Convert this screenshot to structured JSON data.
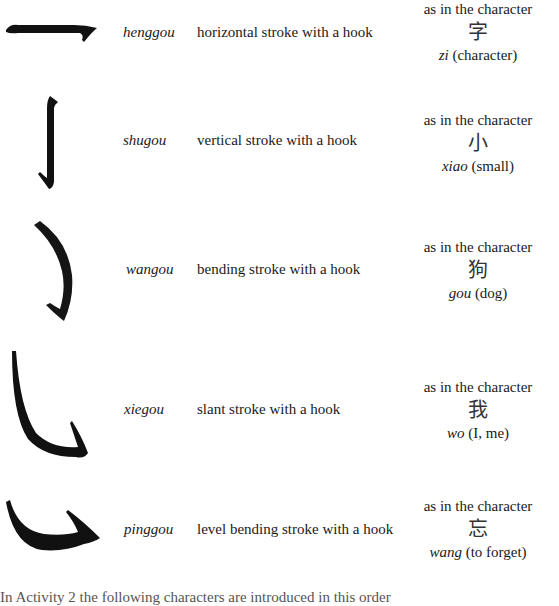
{
  "strokes": [
    {
      "icon": "henggou-stroke-icon",
      "pinyin": "henggou",
      "description": "horizontal stroke with a hook",
      "example_label": "as in the character",
      "example_char": "字",
      "example_pinyin": "zi",
      "example_meaning": "(character)"
    },
    {
      "icon": "shugou-stroke-icon",
      "pinyin": "shugou",
      "description": "vertical stroke with a hook",
      "example_label": "as in the character",
      "example_char": "小",
      "example_pinyin": "xiao",
      "example_meaning": "(small)"
    },
    {
      "icon": "wangou-stroke-icon",
      "pinyin": "wangou",
      "description": "bending stroke with a hook",
      "example_label": "as in the character",
      "example_char": "狗",
      "example_pinyin": "gou",
      "example_meaning": "(dog)"
    },
    {
      "icon": "xiegou-stroke-icon",
      "pinyin": "xiegou",
      "description": "slant stroke with a hook",
      "example_label": "as in the character",
      "example_char": "我",
      "example_pinyin": "wo",
      "example_meaning": "(I, me)"
    },
    {
      "icon": "pinggou-stroke-icon",
      "pinyin": "pinggou",
      "description": "level bending stroke with a hook",
      "example_label": "as in the character",
      "example_char": "忘",
      "example_pinyin": "wang",
      "example_meaning": "(to forget)"
    }
  ],
  "footer": {
    "clipped_text": "In Activity 2 the following characters are introduced in this order"
  },
  "colors": {
    "ink": "#111111",
    "text": "#1a1a1a",
    "background": "#ffffff"
  }
}
